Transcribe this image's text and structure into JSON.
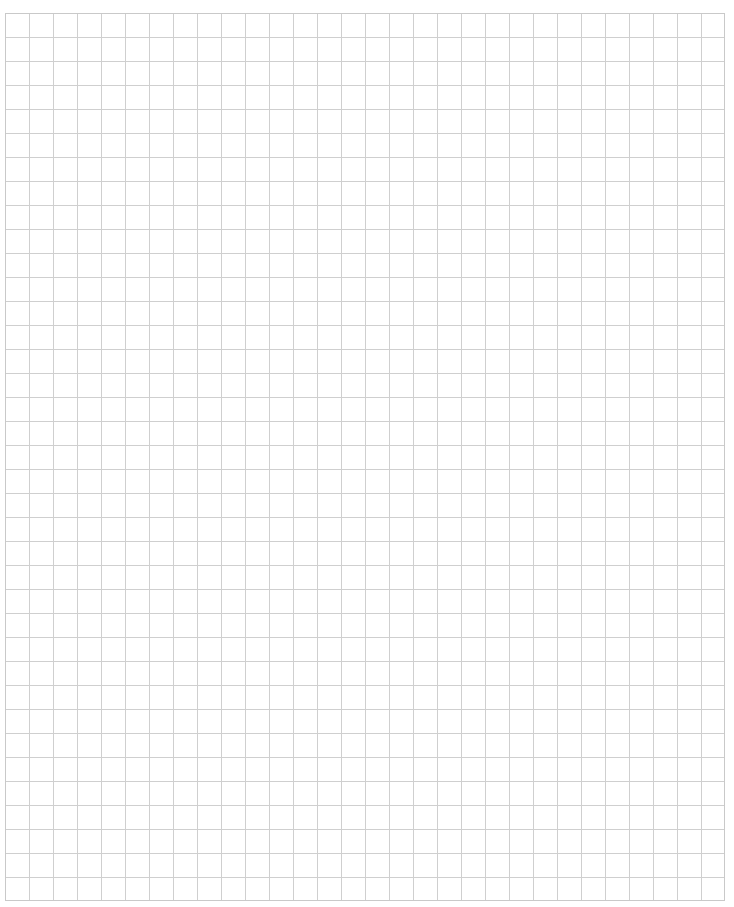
{
  "page": {
    "type": "graph-paper",
    "header_mark": "",
    "grid": {
      "columns": 30,
      "rows": 37,
      "cell_size_px": 24,
      "line_color": "#cfcfcf",
      "border_color": "#c9c9c9",
      "background_color": "#ffffff"
    }
  }
}
